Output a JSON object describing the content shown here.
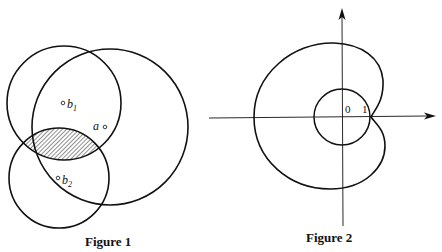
{
  "figure1": {
    "caption": "Figure 1",
    "points": [
      {
        "name": "b",
        "sub": "1"
      },
      {
        "name": "a",
        "sub": ""
      },
      {
        "name": "b",
        "sub": "2"
      }
    ],
    "shaded_region": "intersection of circles b1 and b2"
  },
  "figure2": {
    "caption": "Figure 2",
    "origin_label": "0",
    "unit_label": "1"
  },
  "colors": {
    "ink": "#111111",
    "background": "#ffffff"
  }
}
